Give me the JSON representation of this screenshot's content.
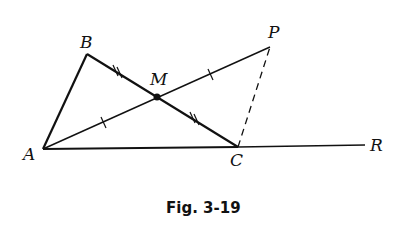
{
  "figure": {
    "caption": "Fig. 3-19",
    "points": {
      "A": {
        "label": "A",
        "x": 43,
        "y": 149
      },
      "B": {
        "label": "B",
        "x": 87,
        "y": 54
      },
      "M": {
        "label": "M",
        "x": 157,
        "y": 97
      },
      "C": {
        "label": "C",
        "x": 238,
        "y": 147
      },
      "P": {
        "label": "P",
        "x": 270,
        "y": 47
      },
      "R": {
        "label": "R",
        "x": 365,
        "y": 145
      }
    },
    "segments": [
      {
        "from": "A",
        "to": "B",
        "style": "solid-thick"
      },
      {
        "from": "B",
        "to": "C",
        "style": "solid-thick",
        "marks": "double-tick"
      },
      {
        "from": "A",
        "to": "P",
        "style": "solid-thin",
        "marks": "single-tick"
      },
      {
        "from": "A",
        "to": "R",
        "style": "solid",
        "note": "ray through C"
      },
      {
        "from": "C",
        "to": "P",
        "style": "dashed"
      }
    ],
    "colors": {
      "stroke": "#111111",
      "background": "#ffffff"
    }
  }
}
